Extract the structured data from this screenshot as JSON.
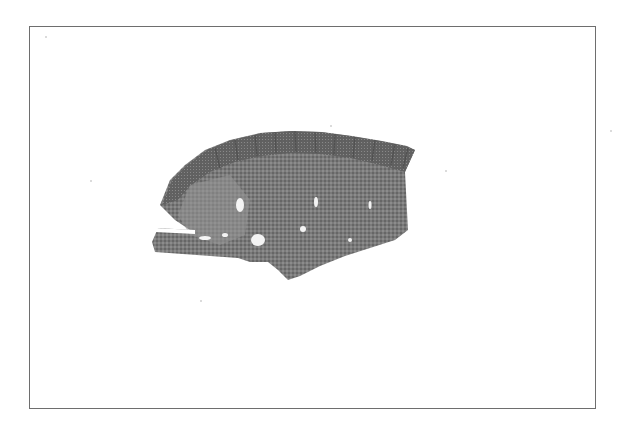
{
  "image": {
    "description": "Grayscale micrograph of a tissue section inside a thin rectangular frame",
    "subject": "histological tissue section with villous/striated upper border",
    "colors": {
      "background": "#ffffff",
      "frame": "#6e6e6e",
      "tissue_dark": "#5a5a5a",
      "tissue_mid": "#7d7d7d",
      "tissue_light": "#a8a8a8",
      "voids": "#f2f2f2"
    }
  }
}
